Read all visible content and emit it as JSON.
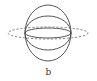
{
  "figure": {
    "caption": "b",
    "stroke_color": "#444444",
    "dashed_color": "#666666",
    "center": {
      "x": 48,
      "y": 33
    },
    "solid_ellipses": [
      {
        "rx": 23,
        "ry": 28
      },
      {
        "rx": 23,
        "ry": 17
      },
      {
        "rx": 23,
        "ry": 5
      }
    ],
    "dashed_ellipse": {
      "rx": 40,
      "ry": 6
    }
  }
}
